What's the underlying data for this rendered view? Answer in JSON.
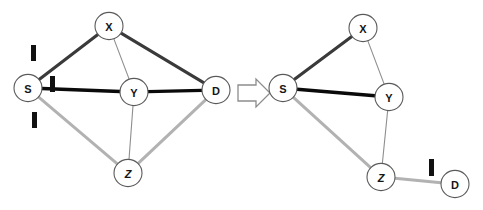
{
  "figure": {
    "type": "graph-transformation-diagram",
    "background_color": "#ffffff",
    "transition_icon": "right-arrow-icon"
  },
  "colors": {
    "node_fill": "#ffffff",
    "node_stroke": "#5a5a5a",
    "label_color": "#151515",
    "edge_dark": "#3a3a3a",
    "edge_black": "#0a0a0a",
    "edge_light": "#b2b2b2",
    "edge_thin": "#8e8e8e",
    "tick_color": "#111111",
    "arrow_stroke": "#8d8d8d"
  },
  "left_graph": {
    "name": "before-graph",
    "nodes": [
      {
        "id": "S",
        "label": "S",
        "cx": 28,
        "cy": 88,
        "r": 14
      },
      {
        "id": "X",
        "label": "X",
        "cx": 109,
        "cy": 26,
        "r": 14
      },
      {
        "id": "Y",
        "label": "Y",
        "cx": 134,
        "cy": 92,
        "r": 14
      },
      {
        "id": "D",
        "label": "D",
        "cx": 216,
        "cy": 90,
        "r": 14
      },
      {
        "id": "Z",
        "label": "Z",
        "cx": 128,
        "cy": 173,
        "r": 14
      }
    ],
    "edges": [
      {
        "from": "S",
        "to": "X",
        "style": "dark"
      },
      {
        "from": "X",
        "to": "D",
        "style": "dark"
      },
      {
        "from": "S",
        "to": "Y",
        "style": "black"
      },
      {
        "from": "Y",
        "to": "D",
        "style": "black"
      },
      {
        "from": "S",
        "to": "Z",
        "style": "light"
      },
      {
        "from": "Z",
        "to": "D",
        "style": "light"
      },
      {
        "from": "X",
        "to": "Y",
        "style": "thin"
      },
      {
        "from": "Y",
        "to": "Z",
        "style": "thin"
      }
    ],
    "ticks": [
      {
        "name": "tick-on-edge-s-x",
        "x": 31,
        "y": 45,
        "w": 5,
        "h": 16,
        "rotate": 0
      },
      {
        "name": "tick-on-edge-s-y",
        "x": 50,
        "y": 76,
        "w": 5,
        "h": 16,
        "rotate": 0
      },
      {
        "name": "tick-on-edge-s-z",
        "x": 32,
        "y": 112,
        "w": 5,
        "h": 16,
        "rotate": 0
      }
    ]
  },
  "right_graph": {
    "name": "after-graph",
    "nodes": [
      {
        "id": "S",
        "label": "S",
        "cx": 283,
        "cy": 88,
        "r": 14
      },
      {
        "id": "X",
        "label": "X",
        "cx": 363,
        "cy": 28,
        "r": 14
      },
      {
        "id": "Y",
        "label": "Y",
        "cx": 389,
        "cy": 97,
        "r": 14
      },
      {
        "id": "Z",
        "label": "Z",
        "cx": 381,
        "cy": 177,
        "r": 14
      },
      {
        "id": "D",
        "label": "D",
        "cx": 455,
        "cy": 184,
        "r": 14
      }
    ],
    "edges": [
      {
        "from": "S",
        "to": "X",
        "style": "dark"
      },
      {
        "from": "S",
        "to": "Y",
        "style": "black"
      },
      {
        "from": "S",
        "to": "Z",
        "style": "light"
      },
      {
        "from": "X",
        "to": "Y",
        "style": "thin"
      },
      {
        "from": "Y",
        "to": "Z",
        "style": "thin"
      },
      {
        "from": "Z",
        "to": "D",
        "style": "light"
      }
    ],
    "ticks": [
      {
        "name": "tick-on-edge-z-d",
        "x": 429,
        "y": 159,
        "w": 5,
        "h": 17,
        "rotate": 0
      }
    ]
  },
  "arrow": {
    "name": "right-arrow-icon",
    "points": "238,85 256,85 256,79 270,93 256,107 256,101 238,101",
    "cx": 254,
    "cy": 93
  }
}
